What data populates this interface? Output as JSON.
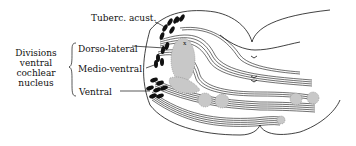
{
  "diagram": {
    "labels": {
      "tuberc_acust": "Tuberc. acust.",
      "dorso_lateral": "Dorso-lateral",
      "medio_ventral": "Medio-ventral",
      "ventral": "Ventral"
    },
    "group_label": {
      "line1": "Divisions",
      "line2": "ventral",
      "line3": "cochlear",
      "line4": "nucleus"
    },
    "marks": {
      "x_marker": "x"
    },
    "colors": {
      "ink": "#111111",
      "background": "#ffffff",
      "stipple": "#888888"
    }
  }
}
